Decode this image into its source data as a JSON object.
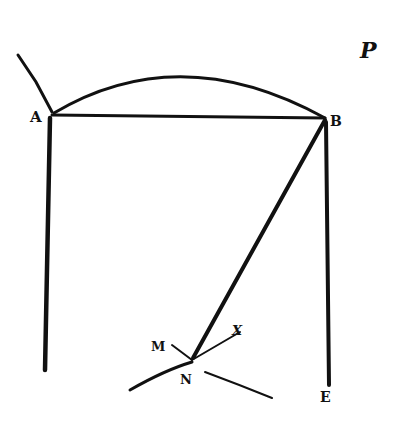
{
  "diagram": {
    "type": "geometric-figure",
    "ink_color": "#111111",
    "background": "#ffffff",
    "labels": {
      "A": "A",
      "B": "B",
      "E": "E",
      "M": "M",
      "N": "N",
      "X": "X",
      "P": "P"
    },
    "points": {
      "A": [
        52,
        115
      ],
      "B": [
        325,
        118
      ],
      "N": [
        193,
        358
      ],
      "E": [
        328,
        385
      ],
      "M": [
        172,
        345
      ],
      "X": [
        240,
        332
      ]
    },
    "elements": [
      "arc from A to B",
      "chord AB",
      "vertical line from A downward",
      "vertical line from B downward to E",
      "line from B to N",
      "line MN",
      "line NX",
      "curve through N",
      "tangent stroke at A"
    ]
  }
}
